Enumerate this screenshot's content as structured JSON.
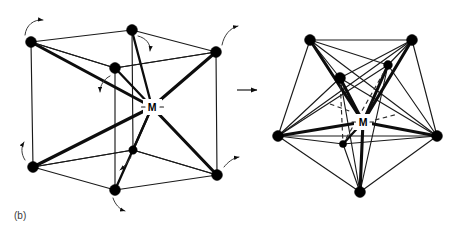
{
  "figure": {
    "panel_label": "(b)",
    "caption_domain": "coordination polyhedron rearrangement diagram",
    "background_color": "#ffffff",
    "ink_color": "#000000",
    "width": 471,
    "height": 229
  },
  "transition": {
    "arrow_name": "rightwards-arrow",
    "glyph": "→",
    "x1": 237,
    "y1": 90,
    "x2": 262,
    "y2": 90
  },
  "left_structure": {
    "name": "cube-eight-coordinate",
    "center_label": "M",
    "center_x": 152,
    "center_y": 107,
    "vertex_count": 8,
    "vertices": [
      {
        "id": "back-top-left",
        "x": 31,
        "y": 42,
        "r": 5.4
      },
      {
        "id": "back-top-right",
        "x": 132,
        "y": 30,
        "r": 5.4
      },
      {
        "id": "front-top-right",
        "x": 216,
        "y": 52,
        "r": 5.4
      },
      {
        "id": "front-top-left",
        "x": 115,
        "y": 68,
        "r": 5.4
      },
      {
        "id": "back-bot-left",
        "x": 33,
        "y": 167,
        "r": 5.4
      },
      {
        "id": "back-bot-right",
        "x": 133,
        "y": 150,
        "r": 4.2
      },
      {
        "id": "front-bot-right",
        "x": 217,
        "y": 175,
        "r": 5.4
      },
      {
        "id": "front-bot-left",
        "x": 115,
        "y": 190,
        "r": 5.4
      }
    ],
    "rotation_arrows": [
      {
        "id": "arrow-back-top-left",
        "x": 40,
        "y": 22
      },
      {
        "id": "arrow-back-top-right",
        "x": 142,
        "y": 42
      },
      {
        "id": "arrow-front-top-right",
        "x": 223,
        "y": 30
      },
      {
        "id": "arrow-front-top-left",
        "x": 104,
        "y": 84
      },
      {
        "id": "arrow-back-bot-left",
        "x": 24,
        "y": 152
      },
      {
        "id": "arrow-back-bot-right",
        "x": 126,
        "y": 166
      },
      {
        "id": "arrow-front-bot-right",
        "x": 228,
        "y": 158
      },
      {
        "id": "arrow-front-bot-left",
        "x": 124,
        "y": 205
      }
    ]
  },
  "right_structure": {
    "name": "dodecahedron-eight-coordinate",
    "center_label": "M",
    "center_x": 363,
    "center_y": 122,
    "vertex_count": 8,
    "vertices": [
      {
        "id": "top-left",
        "x": 310,
        "y": 40,
        "r": 5.4
      },
      {
        "id": "top-right",
        "x": 412,
        "y": 40,
        "r": 5.4
      },
      {
        "id": "inner-upper-left",
        "x": 340,
        "y": 78,
        "r": 5.4
      },
      {
        "id": "inner-upper-right",
        "x": 388,
        "y": 65,
        "r": 4.4
      },
      {
        "id": "left",
        "x": 278,
        "y": 136,
        "r": 5.4
      },
      {
        "id": "right",
        "x": 437,
        "y": 136,
        "r": 5.4
      },
      {
        "id": "inner-lower",
        "x": 343,
        "y": 144,
        "r": 3.6
      },
      {
        "id": "bottom",
        "x": 360,
        "y": 192,
        "r": 5.4
      }
    ]
  }
}
